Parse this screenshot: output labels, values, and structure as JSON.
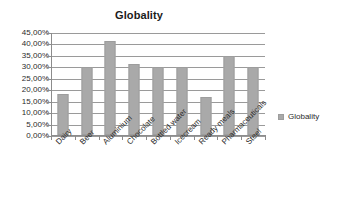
{
  "chart_data": {
    "type": "bar",
    "title": "Globality",
    "xlabel": "",
    "ylabel": "",
    "ylim": [
      0,
      45
    ],
    "ytick_labels": [
      "0,00%",
      "5,00%",
      "10,00%",
      "15,00%",
      "20,00%",
      "25,00%",
      "30,00%",
      "35,00%",
      "40,00%",
      "45,00%"
    ],
    "ytick_values": [
      0,
      5,
      10,
      15,
      20,
      25,
      30,
      35,
      40,
      45
    ],
    "grid": true,
    "legend_position": "right",
    "categories": [
      "Dairy",
      "Beer",
      "Aluminium",
      "Chocolate",
      "Bottled water",
      "Icecream",
      "Ready meals",
      "Pharmaceuticals",
      "Steel"
    ],
    "series": [
      {
        "name": "Globality",
        "color": "#a9a9a9",
        "values": [
          17.8,
          29.8,
          41.0,
          31.0,
          29.8,
          29.8,
          16.7,
          34.5,
          29.8
        ]
      }
    ]
  },
  "legend": {
    "entries": [
      {
        "label": "Globality",
        "color": "#a9a9a9"
      }
    ]
  }
}
